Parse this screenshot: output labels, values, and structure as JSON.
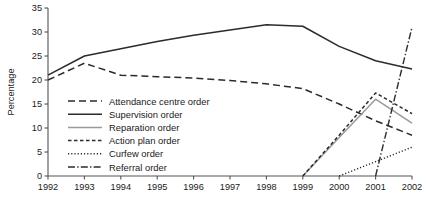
{
  "chart_data": {
    "type": "line",
    "title": "",
    "xlabel": "",
    "ylabel": "Percentage",
    "x": [
      1992,
      1993,
      1994,
      1995,
      1996,
      1997,
      1998,
      1999,
      2000,
      2001,
      2002
    ],
    "xtick_labels": [
      "1992",
      "1993",
      "1994",
      "1995",
      "1996",
      "1997",
      "1998",
      "1999",
      "2000",
      "2001",
      "2002"
    ],
    "ytick_labels": [
      "0",
      "5",
      "10",
      "15",
      "20",
      "25",
      "30",
      "35"
    ],
    "yticks": [
      0,
      5,
      10,
      15,
      20,
      25,
      30,
      35
    ],
    "ylim": [
      0,
      35
    ],
    "xlim": [
      1992,
      2002
    ],
    "grid": false,
    "legend_position": "inside-lower-left",
    "series": [
      {
        "name": "Attendance centre order",
        "style": "dashed",
        "color": "#2b2b2b",
        "x": [
          1992,
          1993,
          1994,
          1995,
          1996,
          1997,
          1998,
          1999,
          2000,
          2001,
          2002
        ],
        "values": [
          20.0,
          23.5,
          21.0,
          20.7,
          20.4,
          19.9,
          19.2,
          18.2,
          15.0,
          11.5,
          8.5
        ]
      },
      {
        "name": "Supervision order",
        "style": "solid",
        "color": "#2b2b2b",
        "x": [
          1992,
          1993,
          1994,
          1995,
          1996,
          1997,
          1998,
          1999,
          2000,
          2001,
          2002
        ],
        "values": [
          21.0,
          25.0,
          26.5,
          28.0,
          29.3,
          30.4,
          31.5,
          31.2,
          27.0,
          24.0,
          22.3
        ]
      },
      {
        "name": "Reparation order",
        "style": "solid-gray",
        "color": "#9a9a9a",
        "x": [
          1999,
          2000,
          2001,
          2002
        ],
        "values": [
          0.0,
          8.0,
          16.0,
          11.0
        ]
      },
      {
        "name": "Action plan order",
        "style": "short-dashed",
        "color": "#2b2b2b",
        "x": [
          1999,
          2000,
          2001,
          2002
        ],
        "values": [
          0.0,
          8.5,
          17.3,
          13.0
        ]
      },
      {
        "name": "Curfew order",
        "style": "dotted",
        "color": "#2b2b2b",
        "x": [
          2000,
          2001,
          2002
        ],
        "values": [
          0.0,
          3.0,
          6.0
        ]
      },
      {
        "name": "Referral order",
        "style": "dash-dot",
        "color": "#2b2b2b",
        "x": [
          2001,
          2002
        ],
        "values": [
          0.0,
          31.0
        ]
      }
    ]
  },
  "legend": {
    "items": [
      {
        "label": "Attendance centre order",
        "style": "dashed",
        "color": "#2b2b2b"
      },
      {
        "label": "Supervision order",
        "style": "solid",
        "color": "#2b2b2b"
      },
      {
        "label": "Reparation order",
        "style": "solid-gray",
        "color": "#9a9a9a"
      },
      {
        "label": "Action plan order",
        "style": "short-dashed",
        "color": "#2b2b2b"
      },
      {
        "label": "Curfew order",
        "style": "dotted",
        "color": "#2b2b2b"
      },
      {
        "label": "Referral order",
        "style": "dash-dot",
        "color": "#2b2b2b"
      }
    ]
  }
}
